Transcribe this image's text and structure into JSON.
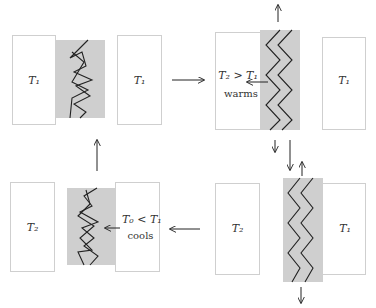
{
  "panels": {
    "top_left": {
      "left_label": "T₁",
      "right_label": "T₁"
    },
    "top_right": {
      "left_label": "T₂ > T₁",
      "left_note": "warms",
      "right_label": "T₁"
    },
    "bottom_right": {
      "left_label": "T₂",
      "right_label": "T₁"
    },
    "bottom_left": {
      "left_label": "T₂",
      "right_label": "T₀ < T₁",
      "right_note": "cools"
    }
  },
  "colors": {
    "band": "#cfcfcf",
    "box_border": "#cfcfcf",
    "line": "#222222"
  }
}
